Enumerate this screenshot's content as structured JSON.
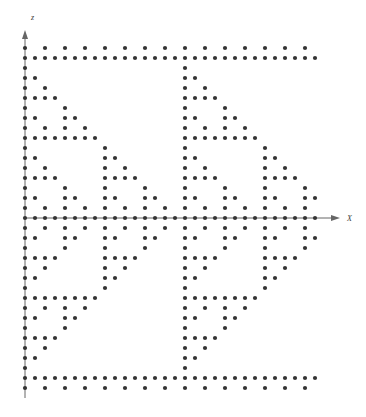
{
  "figure": {
    "title": "",
    "background_color": "#ffffff",
    "width": 366,
    "height": 417
  },
  "axes": {
    "x_axis": {
      "label": "X",
      "name": "x-axis",
      "orientation": "horizontal",
      "arrow": true,
      "color": "#555555"
    },
    "z_axis": {
      "label": "z",
      "name": "z-axis",
      "orientation": "vertical",
      "arrow": true,
      "color": "#555555"
    }
  },
  "marker": {
    "shape": "circle",
    "color": "#343434",
    "radius_px": 2.1
  },
  "chart_data": {
    "type": "scatter",
    "title": "",
    "xlabel": "X",
    "ylabel": "z",
    "grid": false,
    "legend": null,
    "lattice": {
      "origin_px": [
        25,
        218
      ],
      "step_px": 10,
      "i_range": [
        0,
        29
      ],
      "j_range": [
        -18,
        17
      ],
      "description": "Sierpinski / Pascal-mod-2 style binary lattice, mirrored about the X axis"
    },
    "rule": "point (i,j) plotted when ((i & abs(j)) == 0) OR (i==0) OR (j==0) OR ((i % 12 == 0)) OR ((abs(j) % 12 == 0) && (i & abs(j)) == 0)",
    "axis_rows": {
      "x_axis_row_j": 0,
      "z_axis_col_i": 0
    },
    "x": [],
    "y": [],
    "xlim": [
      0,
      29
    ],
    "ylim": [
      -18,
      17
    ]
  }
}
